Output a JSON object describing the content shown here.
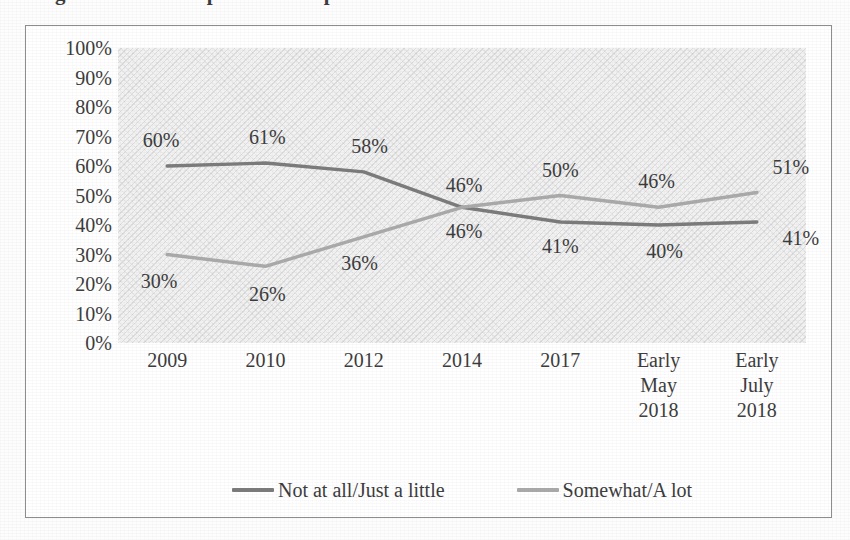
{
  "title": "Figure 1. Trend in perceived impact over time",
  "chart_data": {
    "type": "line",
    "title": "",
    "xlabel": "",
    "ylabel": "",
    "ylim": [
      0,
      100
    ],
    "ytick_step": 10,
    "grid": false,
    "legend_position": "bottom",
    "categories": [
      "2009",
      "2010",
      "2012",
      "2014",
      "2017",
      "Early\nMay\n2018",
      "Early\nJuly\n2018"
    ],
    "yticks": [
      "100%",
      "90%",
      "80%",
      "70%",
      "60%",
      "50%",
      "40%",
      "30%",
      "20%",
      "10%",
      "0%"
    ],
    "series": [
      {
        "name": "Not at all/Just a little",
        "color": "#7a7a7a",
        "values": [
          60,
          61,
          58,
          46,
          41,
          40,
          41
        ],
        "labels": [
          "60%",
          "61%",
          "58%",
          "46%",
          "41%",
          "40%",
          "41%"
        ]
      },
      {
        "name": "Somewhat/A lot",
        "color": "#a9a9a9",
        "values": [
          30,
          26,
          36,
          46,
          50,
          46,
          51
        ],
        "labels": [
          "30%",
          "26%",
          "36%",
          "46%",
          "50%",
          "46%",
          "51%"
        ]
      }
    ]
  },
  "colors": {
    "series_dark": "#7a7a7a",
    "series_light": "#a9a9a9",
    "plot_background": "#f2f2f2",
    "frame_border": "#8d8d8d",
    "text": "#3a3a3a"
  }
}
